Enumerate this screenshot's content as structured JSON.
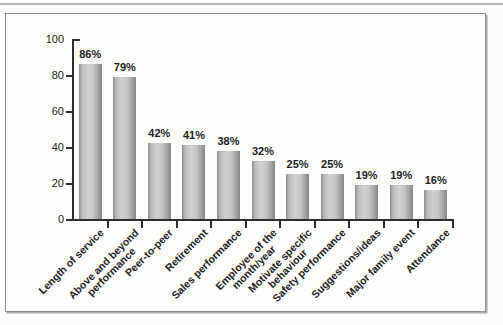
{
  "page": {
    "background": "#fcfcfa",
    "top_rule_color": "#b5b5b3",
    "frame_border_color": "#8f8f8f"
  },
  "chart_data": {
    "type": "bar",
    "title": "",
    "xlabel": "",
    "ylabel": "",
    "categories": [
      "Length of service",
      "Above and beyond performance",
      "Peer-to-peer",
      "Retirement",
      "Sales performance",
      "Employee of the month/year",
      "Motivate specific behaviour",
      "Safety performance",
      "Suggestions/ideas",
      "Major family event",
      "Attendance"
    ],
    "category_lines": [
      [
        "Length of service"
      ],
      [
        "Above and beyond",
        "performance"
      ],
      [
        "Peer-to-peer"
      ],
      [
        "Retirement"
      ],
      [
        "Sales performance"
      ],
      [
        "Employee of the",
        "month/year"
      ],
      [
        "Motivate specific",
        "behaviour"
      ],
      [
        "Safety performance"
      ],
      [
        "Suggestions/ideas"
      ],
      [
        "Major family event"
      ],
      [
        "Attendance"
      ]
    ],
    "values": [
      86,
      79,
      42,
      41,
      38,
      32,
      25,
      25,
      19,
      19,
      16
    ],
    "data_labels": [
      "86%",
      "79%",
      "42%",
      "41%",
      "38%",
      "32%",
      "25%",
      "25%",
      "19%",
      "19%",
      "16%"
    ],
    "ylim": [
      0,
      100
    ],
    "yticks": [
      0,
      20,
      40,
      60,
      80,
      100
    ],
    "ytick_labels": [
      "0",
      "20",
      "40",
      "60",
      "80",
      "100"
    ],
    "grid": false,
    "legend": null,
    "bar_color_light": "#d0d0ce",
    "bar_color_dark": "#858583",
    "axis_color": "#2e2e2e",
    "text_color": "#1d1d1d"
  }
}
